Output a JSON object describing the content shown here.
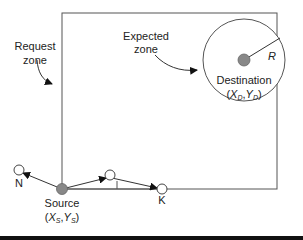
{
  "diagram": {
    "labels": {
      "request_zone_line1": "Request",
      "request_zone_line2": "zone",
      "expected_zone_line1": "Expected",
      "expected_zone_line2": "zone",
      "radius": "R",
      "destination": "Destination",
      "destination_coord_open": "(",
      "destination_x": "X",
      "destination_x_sub": "D",
      "destination_comma": ",",
      "destination_y": "Y",
      "destination_y_sub": "D",
      "destination_coord_close": ")",
      "source": "Source",
      "source_coord_open": "(",
      "source_x": "X",
      "source_x_sub": "S",
      "source_comma": ",",
      "source_y": "Y",
      "source_y_sub": "S",
      "source_coord_close": ")",
      "node_n": "N",
      "node_i": "I",
      "node_k": "K"
    },
    "colors": {
      "line": "#333333",
      "node_fill": "#888888",
      "bottom_rule": "#111111"
    }
  }
}
